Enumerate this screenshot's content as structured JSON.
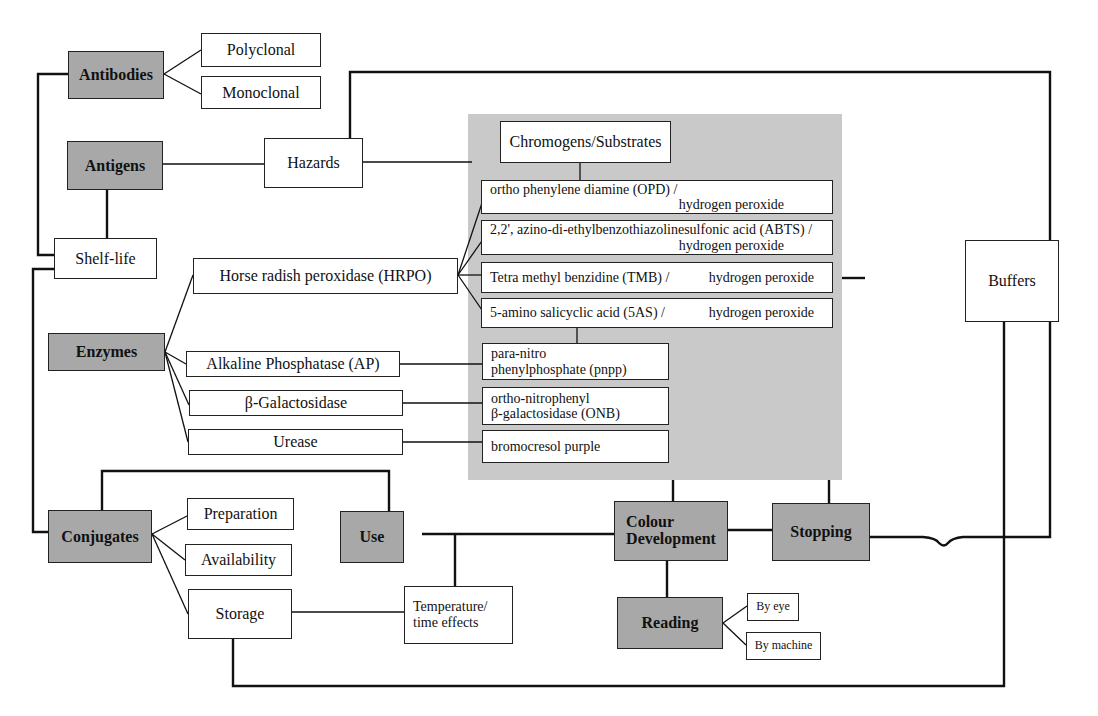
{
  "diagram": {
    "nodes": {
      "antibodies": "Antibodies",
      "polyclonal": "Polyclonal",
      "monoclonal": "Monoclonal",
      "antigens": "Antigens",
      "hazards": "Hazards",
      "shelf_life": "Shelf-life",
      "chromogens": "Chromogens/Substrates",
      "opd": "ortho phenylene diamine (OPD) /",
      "opd_2": "hydrogen peroxide",
      "abts": "2,2', azino-di-ethylbenzothiazolinesulfonic acid  (ABTS) /",
      "abts_2": "hydrogen peroxide",
      "tmb": "Tetra methyl benzidine (TMB) /",
      "tmb_2": "hydrogen peroxide",
      "fas": "5-amino salicyclic acid (5AS) /",
      "fas_2": "hydrogen peroxide",
      "hrpo": "Horse radish peroxidase (HRPO)",
      "buffers": "Buffers",
      "enzymes": "Enzymes",
      "ap": "Alkaline Phosphatase (AP)",
      "pnpp": "para-nitro",
      "pnpp_2": "phenylphosphate (pnpp)",
      "bgal": "β-Galactosidase",
      "onb": "ortho-nitrophenyl",
      "onb_2": "β-galactosidase (ONB)",
      "urease": "Urease",
      "bcp": "bromocresol purple",
      "conjugates": "Conjugates",
      "preparation": "Preparation",
      "availability": "Availability",
      "storage": "Storage",
      "use": "Use",
      "temperature": "Temperature/",
      "temperature_2": "time effects",
      "colour": "Colour",
      "colour_2": "Development",
      "stopping": "Stopping",
      "reading": "Reading",
      "by_eye": "By eye",
      "by_machine": "By machine"
    },
    "colors": {
      "grey_box": "#a8a8a8",
      "shade_panel": "#c9c9c9",
      "line": "#111111"
    }
  }
}
